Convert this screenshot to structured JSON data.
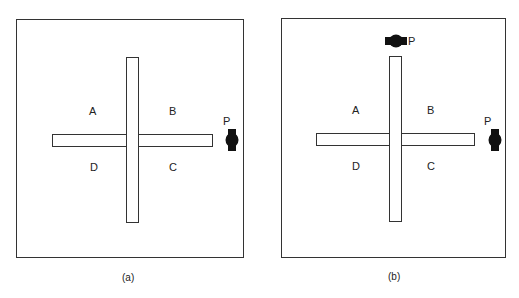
{
  "panels": [
    {
      "caption": "(a)",
      "regions": {
        "A": "A",
        "B": "B",
        "C": "C",
        "D": "D"
      },
      "cameras": [
        {
          "label": "P",
          "position": "right",
          "orientation": "vertical"
        }
      ]
    },
    {
      "caption": "(b)",
      "regions": {
        "A": "A",
        "B": "B",
        "C": "C",
        "D": "D"
      },
      "cameras": [
        {
          "label": "P",
          "position": "top",
          "orientation": "horizontal"
        },
        {
          "label": "P",
          "position": "right",
          "orientation": "vertical"
        }
      ]
    }
  ],
  "colors": {
    "stroke": "#333333",
    "camera": "#111111",
    "background": "#ffffff"
  }
}
